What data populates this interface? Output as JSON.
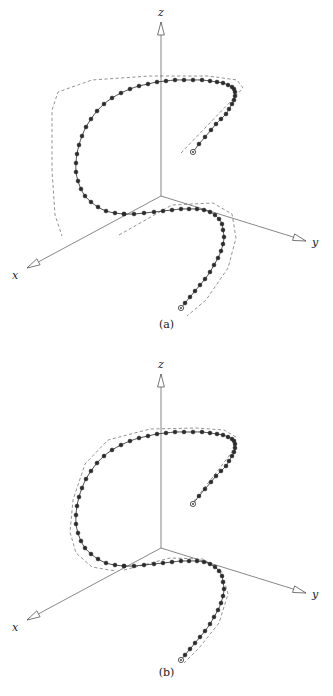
{
  "figure": {
    "kind": "3d-parametric-curve-with-control-polygon",
    "panels": [
      {
        "id": "a",
        "caption": "(a)",
        "axes": {
          "z_label": "z",
          "y_label": "y",
          "x_label": "x",
          "origin": [
            161,
            196
          ],
          "z_tip": [
            161,
            22
          ],
          "y_tip": [
            306,
            241
          ],
          "x_tip": [
            27,
            268
          ],
          "arrow_style": "hollow-triangle"
        },
        "curve_color": "#2b2b2b",
        "polygon_color": "#4a4a4a",
        "polygon_style": "dashed",
        "polygon_fit": "loose",
        "marker_count": 46,
        "endpoint_marker": "open-circle"
      },
      {
        "id": "b",
        "caption": "(b)",
        "axes": {
          "z_label": "z",
          "y_label": "y",
          "x_label": "x",
          "origin": [
            161,
            548
          ],
          "z_tip": [
            161,
            374
          ],
          "y_tip": [
            306,
            593
          ],
          "x_tip": [
            27,
            620
          ],
          "arrow_style": "hollow-triangle"
        },
        "curve_color": "#2b2b2b",
        "polygon_color": "#4a4a4a",
        "polygon_style": "dashed",
        "polygon_fit": "tight",
        "marker_count": 46,
        "endpoint_marker": "open-circle"
      }
    ]
  },
  "chart_data": {
    "type": "line",
    "title": "",
    "xlabel": "x",
    "ylabel": "y",
    "zlabel": "z",
    "grid": false,
    "legend": null,
    "projection": "3d-axonometric",
    "axes_screen": {
      "panel_a": {
        "origin": [
          161,
          196
        ],
        "z_axis_end": [
          161,
          22
        ],
        "y_axis_end": [
          306,
          241
        ],
        "x_axis_end": [
          27,
          268
        ]
      },
      "panel_b": {
        "origin": [
          161,
          548
        ],
        "z_axis_end": [
          161,
          374
        ],
        "y_axis_end": [
          306,
          593
        ],
        "x_axis_end": [
          27,
          620
        ]
      }
    },
    "series": [
      {
        "name": "curve-upper-loop",
        "panel": "a",
        "kind": "curve",
        "points": [
          [
            193,
            152
          ],
          [
            199,
            144
          ],
          [
            205,
            137
          ],
          [
            211,
            130
          ],
          [
            216,
            124
          ],
          [
            221,
            119
          ],
          [
            226,
            114
          ],
          [
            229,
            109
          ],
          [
            232,
            104
          ],
          [
            234,
            100
          ],
          [
            235,
            96
          ],
          [
            235,
            92
          ],
          [
            234,
            89
          ],
          [
            232,
            87
          ],
          [
            228,
            85
          ],
          [
            223,
            83
          ],
          [
            217,
            82
          ],
          [
            210,
            81
          ],
          [
            202,
            80
          ],
          [
            193,
            80
          ],
          [
            184,
            80
          ],
          [
            175,
            80
          ],
          [
            166,
            81
          ],
          [
            157,
            82
          ],
          [
            148,
            84
          ],
          [
            139,
            86
          ],
          [
            130,
            89
          ],
          [
            121,
            93
          ],
          [
            112,
            98
          ],
          [
            104,
            104
          ],
          [
            97,
            111
          ],
          [
            91,
            119
          ],
          [
            86,
            127
          ],
          [
            82,
            136
          ],
          [
            79,
            145
          ],
          [
            77,
            154
          ],
          [
            76,
            163
          ],
          [
            76,
            172
          ],
          [
            78,
            181
          ],
          [
            81,
            189
          ],
          [
            85,
            196
          ],
          [
            91,
            202
          ],
          [
            98,
            207
          ],
          [
            106,
            211
          ],
          [
            115,
            213
          ],
          [
            124,
            214
          ]
        ]
      },
      {
        "name": "curve-lower-loop",
        "panel": "a",
        "kind": "curve",
        "points": [
          [
            124,
            214
          ],
          [
            134,
            214
          ],
          [
            144,
            213
          ],
          [
            154,
            212
          ],
          [
            163,
            211
          ],
          [
            172,
            210
          ],
          [
            181,
            209
          ],
          [
            189,
            209
          ],
          [
            197,
            209
          ],
          [
            204,
            210
          ],
          [
            210,
            212
          ],
          [
            215,
            215
          ],
          [
            219,
            219
          ],
          [
            222,
            224
          ],
          [
            223,
            230
          ],
          [
            224,
            237
          ],
          [
            223,
            244
          ],
          [
            221,
            251
          ],
          [
            218,
            258
          ],
          [
            214,
            265
          ],
          [
            210,
            272
          ],
          [
            205,
            279
          ],
          [
            200,
            285
          ],
          [
            195,
            291
          ],
          [
            190,
            297
          ],
          [
            185,
            303
          ],
          [
            181,
            308
          ]
        ]
      },
      {
        "name": "curve-upper-loop",
        "panel": "b",
        "kind": "curve",
        "points": [
          [
            193,
            504
          ],
          [
            199,
            496
          ],
          [
            205,
            489
          ],
          [
            211,
            482
          ],
          [
            216,
            476
          ],
          [
            221,
            471
          ],
          [
            226,
            466
          ],
          [
            229,
            461
          ],
          [
            232,
            456
          ],
          [
            234,
            452
          ],
          [
            235,
            448
          ],
          [
            235,
            444
          ],
          [
            234,
            441
          ],
          [
            232,
            439
          ],
          [
            228,
            437
          ],
          [
            223,
            435
          ],
          [
            217,
            434
          ],
          [
            210,
            433
          ],
          [
            202,
            432
          ],
          [
            193,
            432
          ],
          [
            184,
            432
          ],
          [
            175,
            432
          ],
          [
            166,
            433
          ],
          [
            157,
            434
          ],
          [
            148,
            436
          ],
          [
            139,
            438
          ],
          [
            130,
            441
          ],
          [
            121,
            445
          ],
          [
            112,
            450
          ],
          [
            104,
            456
          ],
          [
            97,
            463
          ],
          [
            91,
            471
          ],
          [
            86,
            479
          ],
          [
            82,
            488
          ],
          [
            79,
            497
          ],
          [
            77,
            506
          ],
          [
            76,
            515
          ],
          [
            76,
            524
          ],
          [
            78,
            533
          ],
          [
            81,
            541
          ],
          [
            85,
            548
          ],
          [
            91,
            554
          ],
          [
            98,
            559
          ],
          [
            106,
            563
          ],
          [
            115,
            565
          ],
          [
            124,
            566
          ]
        ]
      },
      {
        "name": "curve-lower-loop",
        "panel": "b",
        "kind": "curve",
        "points": [
          [
            124,
            566
          ],
          [
            134,
            566
          ],
          [
            144,
            565
          ],
          [
            154,
            564
          ],
          [
            163,
            563
          ],
          [
            172,
            562
          ],
          [
            181,
            561
          ],
          [
            189,
            561
          ],
          [
            197,
            561
          ],
          [
            204,
            562
          ],
          [
            210,
            564
          ],
          [
            215,
            567
          ],
          [
            219,
            571
          ],
          [
            222,
            576
          ],
          [
            223,
            582
          ],
          [
            224,
            589
          ],
          [
            223,
            596
          ],
          [
            221,
            603
          ],
          [
            218,
            610
          ],
          [
            214,
            617
          ],
          [
            210,
            624
          ],
          [
            205,
            631
          ],
          [
            200,
            637
          ],
          [
            195,
            643
          ],
          [
            190,
            649
          ],
          [
            185,
            655
          ],
          [
            181,
            660
          ]
        ]
      },
      {
        "name": "control-polygon-upper",
        "panel": "a",
        "kind": "polygon",
        "points": [
          [
            181,
            153
          ],
          [
            232,
            100
          ],
          [
            243,
            88
          ],
          [
            237,
            80
          ],
          [
            208,
            76
          ],
          [
            150,
            76
          ],
          [
            92,
            80
          ],
          [
            58,
            92
          ],
          [
            52,
            110
          ],
          [
            52,
            170
          ],
          [
            55,
            215
          ],
          [
            62,
            236
          ]
        ]
      },
      {
        "name": "control-polygon-lower",
        "panel": "a",
        "kind": "polygon",
        "points": [
          [
            119,
            235
          ],
          [
            172,
            205
          ],
          [
            213,
            203
          ],
          [
            232,
            214
          ],
          [
            236,
            238
          ],
          [
            228,
            268
          ],
          [
            206,
            300
          ],
          [
            187,
            316
          ]
        ]
      },
      {
        "name": "control-polygon-upper",
        "panel": "b",
        "kind": "polygon",
        "points": [
          [
            190,
            506
          ],
          [
            216,
            473
          ],
          [
            232,
            452
          ],
          [
            236,
            437
          ],
          [
            224,
            430
          ],
          [
            196,
            428
          ],
          [
            150,
            429
          ],
          [
            108,
            440
          ],
          [
            85,
            464
          ],
          [
            73,
            500
          ],
          [
            70,
            532
          ],
          [
            76,
            553
          ],
          [
            92,
            567
          ],
          [
            116,
            571
          ]
        ]
      },
      {
        "name": "control-polygon-lower",
        "panel": "b",
        "kind": "polygon",
        "points": [
          [
            124,
            570
          ],
          [
            170,
            558
          ],
          [
            203,
            559
          ],
          [
            222,
            572
          ],
          [
            228,
            594
          ],
          [
            219,
            623
          ],
          [
            199,
            648
          ],
          [
            184,
            663
          ]
        ]
      }
    ],
    "markers": {
      "style": "filled-circle",
      "endpoint_style": "open-circle",
      "radius": 2.0,
      "endpoint_radius": 2.6,
      "count_per_panel": 46
    }
  }
}
